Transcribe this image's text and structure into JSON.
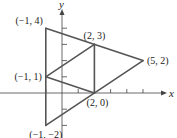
{
  "diagram": {
    "axes": {
      "x_label": "x",
      "y_label": "y",
      "x_ticks": [
        -1,
        1,
        2,
        3,
        4,
        5
      ],
      "y_ticks": [
        -2,
        -1,
        1,
        2,
        3,
        4
      ]
    },
    "points": [
      {
        "id": "A",
        "x": -1,
        "y": 4,
        "label": "(−1, 4)",
        "anchor": "above-left"
      },
      {
        "id": "B",
        "x": 2,
        "y": 3,
        "label": "(2, 3)",
        "anchor": "above"
      },
      {
        "id": "C",
        "x": 5,
        "y": 2,
        "label": "(5, 2)",
        "anchor": "right"
      },
      {
        "id": "D",
        "x": -1,
        "y": 1,
        "label": "(−1, 1)",
        "anchor": "left"
      },
      {
        "id": "E",
        "x": 2,
        "y": 0,
        "label": "(2, 0)",
        "anchor": "below"
      },
      {
        "id": "F",
        "x": -1,
        "y": -2,
        "label": "(−1, −2)",
        "anchor": "below-left"
      }
    ],
    "segments": [
      [
        "A",
        "C"
      ],
      [
        "C",
        "F"
      ],
      [
        "F",
        "A"
      ],
      [
        "D",
        "B"
      ],
      [
        "B",
        "E"
      ],
      [
        "E",
        "D"
      ]
    ]
  }
}
